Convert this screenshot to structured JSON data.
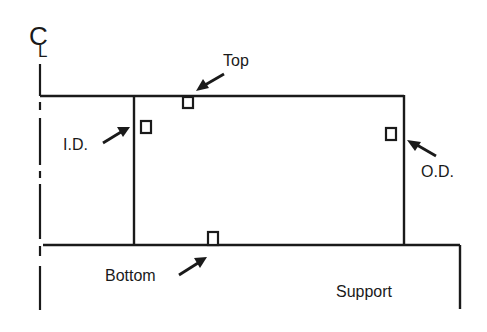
{
  "diagram": {
    "centerline_symbol": {
      "main": "C",
      "sub": "L"
    },
    "labels": {
      "top": "Top",
      "inner_diameter": "I.D.",
      "outer_diameter": "O.D.",
      "bottom": "Bottom",
      "support": "Support"
    },
    "colors": {
      "line": "#1a1a1a",
      "background": "#ffffff"
    }
  }
}
